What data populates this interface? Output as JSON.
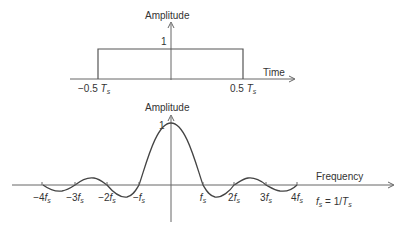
{
  "top_plot": {
    "y_axis_label": "Amplitude",
    "x_axis_label": "Time",
    "amplitude_label": "1",
    "left_tick": "−0.5",
    "right_tick": "0.5",
    "tick_unit": "T",
    "tick_sub": "s"
  },
  "bottom_plot": {
    "y_axis_label": "Amplitude",
    "x_axis_label": "Frequency",
    "peak_label": "1",
    "ticks": [
      {
        "coef": "−4",
        "x": 42
      },
      {
        "coef": "−3",
        "x": 75
      },
      {
        "coef": "−2",
        "x": 107
      },
      {
        "coef": "−",
        "x": 139
      },
      {
        "coef": "",
        "x": 203
      },
      {
        "coef": "2",
        "x": 234
      },
      {
        "coef": "3",
        "x": 266
      },
      {
        "coef": "4",
        "x": 297
      }
    ],
    "tick_unit": "f",
    "tick_sub": "s",
    "relation": {
      "lhs": "f",
      "lhs_sub": "s",
      "eq": " = 1/",
      "rhs": "T",
      "rhs_sub": "s"
    }
  },
  "colors": {
    "line": "#555555",
    "text": "#333333"
  }
}
